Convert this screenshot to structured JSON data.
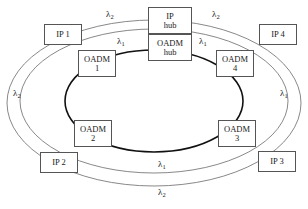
{
  "diagram": {
    "colors": {
      "inner_ring_stroke": "#111111",
      "outer_ring_stroke": "#7a7a7a",
      "box_border": "#555555",
      "text": "#1a1a1a",
      "background": "#ffffff"
    },
    "nodes": [
      {
        "id": "ip1",
        "kind": "ip",
        "line1": "IP 1",
        "line2": ""
      },
      {
        "id": "ip2",
        "kind": "ip",
        "line1": "IP 2",
        "line2": ""
      },
      {
        "id": "ip3",
        "kind": "ip",
        "line1": "IP 3",
        "line2": ""
      },
      {
        "id": "ip4",
        "kind": "ip",
        "line1": "IP 4",
        "line2": ""
      },
      {
        "id": "oadm1",
        "kind": "oadm",
        "line1": "OADM",
        "line2": "1"
      },
      {
        "id": "oadm2",
        "kind": "oadm",
        "line1": "OADM",
        "line2": "2"
      },
      {
        "id": "oadm3",
        "kind": "oadm",
        "line1": "OADM",
        "line2": "3"
      },
      {
        "id": "oadm4",
        "kind": "oadm",
        "line1": "OADM",
        "line2": "4"
      },
      {
        "id": "iphub",
        "kind": "hub",
        "line1": "IP",
        "line2": "hub"
      },
      {
        "id": "oadmhub",
        "kind": "hub",
        "line1": "OADM",
        "line2": "hub"
      }
    ],
    "wavelength_labels": [
      {
        "id": "top-left",
        "symbol": "λ",
        "sub": "2"
      },
      {
        "id": "top-right",
        "symbol": "λ",
        "sub": "2"
      },
      {
        "id": "inner-top-left",
        "symbol": "λ",
        "sub": "1"
      },
      {
        "id": "inner-top-right",
        "symbol": "λ",
        "sub": "1"
      },
      {
        "id": "left",
        "symbol": "λ",
        "sub": "2"
      },
      {
        "id": "right",
        "symbol": "λ",
        "sub": "1"
      },
      {
        "id": "bottom-inner",
        "symbol": "λ",
        "sub": "1"
      },
      {
        "id": "bottom-outer",
        "symbol": "λ",
        "sub": "2"
      }
    ]
  }
}
